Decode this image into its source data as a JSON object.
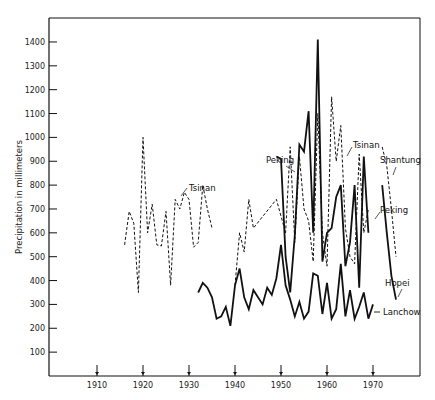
{
  "chart_data": {
    "type": "line",
    "title": "",
    "xlabel": "",
    "ylabel": "Precipitation in millimeters",
    "xlim": [
      1900,
      1980
    ],
    "ylim": [
      0,
      1500
    ],
    "grid": false,
    "x_ticks": [
      1910,
      1920,
      1930,
      1940,
      1950,
      1960,
      1970
    ],
    "x_tick_labels": [
      "1910",
      "1920",
      "1930",
      "1940",
      "1950",
      "1960",
      "1970"
    ],
    "y_ticks": [
      100,
      200,
      300,
      400,
      500,
      600,
      700,
      800,
      900,
      1000,
      1100,
      1200,
      1300,
      1400
    ],
    "y_tick_labels": [
      "100",
      "200",
      "300",
      "400",
      "500",
      "600",
      "700",
      "800",
      "900",
      "1000",
      "1100",
      "1200",
      "1300",
      "1400"
    ],
    "x_tick_marker": "arrow-up",
    "legend": "inline labels",
    "series": [
      {
        "name": "Tsinan",
        "style": "dashed",
        "segment": "early",
        "x": [
          1916,
          1917,
          1918,
          1919,
          1920,
          1921,
          1922,
          1923,
          1924,
          1925,
          1926,
          1927,
          1928,
          1929,
          1930,
          1931,
          1932,
          1933,
          1934,
          1935
        ],
        "values": [
          550,
          690,
          640,
          350,
          1000,
          600,
          720,
          550,
          545,
          690,
          380,
          740,
          700,
          770,
          740,
          540,
          560,
          800,
          700,
          620
        ]
      },
      {
        "name": "Tsinan",
        "style": "dashed",
        "segment": "late",
        "x": [
          1940,
          1941,
          1942,
          1943,
          1944,
          1949,
          1951,
          1952,
          1953,
          1954,
          1955,
          1956,
          1957,
          1958,
          1959,
          1960,
          1961,
          1962,
          1963,
          1964,
          1965,
          1966,
          1967,
          1968,
          1969
        ],
        "values": [
          380,
          600,
          520,
          740,
          620,
          740,
          600,
          960,
          560,
          920,
          700,
          650,
          480,
          1100,
          600,
          460,
          1170,
          900,
          1050,
          620,
          500,
          470,
          930,
          600,
          700
        ]
      },
      {
        "name": "Peking",
        "style": "solid",
        "x": [
          1949,
          1950,
          1951,
          1952,
          1953,
          1954,
          1955,
          1956,
          1957,
          1958,
          1959,
          1960,
          1961,
          1962,
          1963,
          1964,
          1965,
          1966,
          1967,
          1968,
          1969
        ],
        "values": [
          920,
          910,
          500,
          350,
          590,
          970,
          940,
          1110,
          600,
          1410,
          480,
          600,
          620,
          750,
          800,
          460,
          560,
          800,
          370,
          920,
          600
        ]
      },
      {
        "name": "Lanchow",
        "style": "solid",
        "x": [
          1932,
          1933,
          1934,
          1935,
          1936,
          1937,
          1938,
          1939,
          1940,
          1941,
          1942,
          1943,
          1944,
          1945,
          1946,
          1947,
          1948,
          1949,
          1950,
          1951,
          1952,
          1953,
          1954,
          1955,
          1956,
          1957,
          1958,
          1959,
          1960,
          1961,
          1962,
          1963,
          1964,
          1965,
          1966,
          1967,
          1968,
          1969,
          1970
        ],
        "values": [
          350,
          390,
          370,
          330,
          240,
          250,
          290,
          210,
          380,
          450,
          330,
          280,
          360,
          330,
          300,
          370,
          340,
          410,
          550,
          380,
          320,
          250,
          310,
          240,
          270,
          430,
          420,
          260,
          390,
          240,
          280,
          470,
          250,
          360,
          240,
          290,
          350,
          240,
          300
        ]
      },
      {
        "name": "Shantung",
        "style": "dashed",
        "x": [
          1972,
          1973,
          1974,
          1975
        ],
        "values": [
          960,
          880,
          700,
          500
        ]
      },
      {
        "name": "Hopei",
        "style": "solid",
        "x": [
          1972,
          1973,
          1974,
          1975
        ],
        "values": [
          800,
          600,
          420,
          320
        ]
      }
    ],
    "annotations": [
      {
        "text": "Tsinan",
        "x": 1936,
        "y": 800
      },
      {
        "text": "Peking",
        "x": 1950,
        "y": 960
      },
      {
        "text": "Tsinan",
        "x": 1964,
        "y": 920
      },
      {
        "text": "Shantung",
        "x": 1972,
        "y": 860
      },
      {
        "text": "Peking",
        "x": 1971,
        "y": 640
      },
      {
        "text": "Hopei",
        "x": 1972,
        "y": 410
      },
      {
        "text": "Lanchow",
        "x": 1971,
        "y": 270
      }
    ]
  },
  "labels": {
    "ylabel": "Precipitation in millimeters",
    "tsinan_early": "Tsinan",
    "peking_left": "Peking",
    "tsinan_late": "Tsinan",
    "shantung": "Shantung",
    "peking_right": "Peking",
    "hopei": "Hopei",
    "lanchow": "Lanchow"
  },
  "layout": {
    "plot_left": 49,
    "plot_right": 420,
    "plot_top": 18,
    "plot_bottom": 376,
    "x0_year": 1910,
    "x0_px": 97,
    "px_per_year": 4.6,
    "y_px_per_unit": 0.2386
  }
}
